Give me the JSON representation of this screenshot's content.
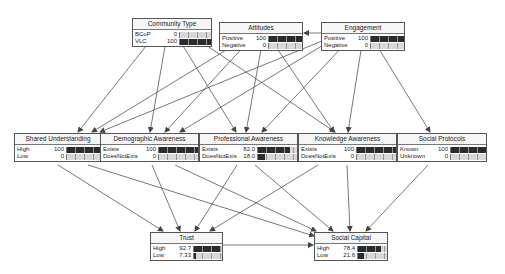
{
  "diagram": {
    "type": "bayesian-network",
    "nodes": [
      {
        "id": "community_type",
        "title": "Community Type",
        "x": 132,
        "y": 18,
        "w": 80,
        "lblw": 28,
        "states": [
          {
            "label": "BCoP",
            "value": "0",
            "pct": 0
          },
          {
            "label": "VLC",
            "value": "100",
            "pct": 100
          }
        ]
      },
      {
        "id": "attitudes",
        "title": "Attitudes",
        "x": 219,
        "y": 22,
        "w": 84,
        "lblw": 32,
        "states": [
          {
            "label": "Positive",
            "value": "100",
            "pct": 100
          },
          {
            "label": "Negative",
            "value": "0",
            "pct": 0
          }
        ]
      },
      {
        "id": "engagement",
        "title": "Engagement",
        "x": 321,
        "y": 22,
        "w": 84,
        "lblw": 32,
        "states": [
          {
            "label": "Positive",
            "value": "100",
            "pct": 100
          },
          {
            "label": "Negative",
            "value": "0",
            "pct": 0
          }
        ]
      },
      {
        "id": "shared_understanding",
        "title": "Shared Understanding",
        "x": 14,
        "y": 133,
        "w": 88,
        "lblw": 30,
        "states": [
          {
            "label": "High",
            "value": "100",
            "pct": 100
          },
          {
            "label": "Low",
            "value": "0",
            "pct": 0
          }
        ]
      },
      {
        "id": "demographic_awareness",
        "title": "Demographic Awareness",
        "x": 100,
        "y": 133,
        "w": 99,
        "lblw": 43,
        "states": [
          {
            "label": "Exists",
            "value": "100",
            "pct": 100
          },
          {
            "label": "DoesNotExist",
            "value": "0",
            "pct": 0
          }
        ]
      },
      {
        "id": "professional_awareness",
        "title": "Professional Awareness",
        "x": 199,
        "y": 133,
        "w": 99,
        "lblw": 43,
        "states": [
          {
            "label": "Exists",
            "value": "82.0",
            "pct": 82
          },
          {
            "label": "DoesNotExist",
            "value": "18.0",
            "pct": 18
          }
        ]
      },
      {
        "id": "knowledge_awareness",
        "title": "Knowledge Awareness",
        "x": 298,
        "y": 133,
        "w": 99,
        "lblw": 43,
        "states": [
          {
            "label": "Exists",
            "value": "100",
            "pct": 100
          },
          {
            "label": "DoesNotExist",
            "value": "0",
            "pct": 0
          }
        ]
      },
      {
        "id": "social_protocols",
        "title": "Social Protocols",
        "x": 397,
        "y": 133,
        "w": 90,
        "lblw": 30,
        "states": [
          {
            "label": "Known",
            "value": "100",
            "pct": 100
          },
          {
            "label": "Unknown",
            "value": "0",
            "pct": 0
          }
        ]
      },
      {
        "id": "trust",
        "title": "Trust",
        "x": 150,
        "y": 232,
        "w": 73,
        "lblw": 22,
        "states": [
          {
            "label": "High",
            "value": "92.7",
            "pct": 92.7
          },
          {
            "label": "Low",
            "value": "7.33",
            "pct": 7.33
          }
        ]
      },
      {
        "id": "social_capital",
        "title": "Social Capital",
        "x": 314,
        "y": 232,
        "w": 74,
        "lblw": 22,
        "states": [
          {
            "label": "High",
            "value": "78.4",
            "pct": 78.4
          },
          {
            "label": "Low",
            "value": "21.6",
            "pct": 21.6
          }
        ]
      }
    ],
    "edges": [
      {
        "from": "community_type",
        "to": "shared_understanding",
        "x1": 150,
        "y1": 41,
        "x2": 78,
        "y2": 132
      },
      {
        "from": "community_type",
        "to": "demographic_awareness",
        "x1": 166,
        "y1": 41,
        "x2": 150,
        "y2": 132
      },
      {
        "from": "community_type",
        "to": "professional_awareness",
        "x1": 180,
        "y1": 41,
        "x2": 236,
        "y2": 132
      },
      {
        "from": "community_type",
        "to": "social_capital",
        "x1": 200,
        "y1": 41,
        "x2": 335,
        "y2": 132
      },
      {
        "from": "attitudes",
        "to": "shared_understanding",
        "x1": 236,
        "y1": 44,
        "x2": 92,
        "y2": 132
      },
      {
        "from": "attitudes",
        "to": "demographic_awareness",
        "x1": 246,
        "y1": 44,
        "x2": 165,
        "y2": 132
      },
      {
        "from": "attitudes",
        "to": "professional_awareness",
        "x1": 262,
        "y1": 44,
        "x2": 246,
        "y2": 132
      },
      {
        "from": "attitudes",
        "to": "knowledge_awareness",
        "x1": 274,
        "y1": 44,
        "x2": 334,
        "y2": 132
      },
      {
        "from": "engagement",
        "to": "attitudes",
        "x1": 321,
        "y1": 33,
        "x2": 304,
        "y2": 33
      },
      {
        "from": "engagement",
        "to": "shared_understanding",
        "x1": 322,
        "y1": 41,
        "x2": 100,
        "y2": 132
      },
      {
        "from": "engagement",
        "to": "demographic_awareness",
        "x1": 330,
        "y1": 41,
        "x2": 180,
        "y2": 132
      },
      {
        "from": "engagement",
        "to": "professional_awareness",
        "x1": 345,
        "y1": 44,
        "x2": 262,
        "y2": 132
      },
      {
        "from": "engagement",
        "to": "knowledge_awareness",
        "x1": 362,
        "y1": 44,
        "x2": 348,
        "y2": 132
      },
      {
        "from": "engagement",
        "to": "social_protocols",
        "x1": 376,
        "y1": 44,
        "x2": 430,
        "y2": 132
      },
      {
        "from": "shared_understanding",
        "to": "trust",
        "x1": 58,
        "y1": 165,
        "x2": 163,
        "y2": 231
      },
      {
        "from": "shared_understanding",
        "to": "social_capital",
        "x1": 88,
        "y1": 165,
        "x2": 314,
        "y2": 236
      },
      {
        "from": "demographic_awareness",
        "to": "trust",
        "x1": 152,
        "y1": 165,
        "x2": 180,
        "y2": 231
      },
      {
        "from": "demographic_awareness",
        "to": "social_capital",
        "x1": 175,
        "y1": 165,
        "x2": 316,
        "y2": 231
      },
      {
        "from": "professional_awareness",
        "to": "trust",
        "x1": 237,
        "y1": 165,
        "x2": 195,
        "y2": 231
      },
      {
        "from": "professional_awareness",
        "to": "social_capital",
        "x1": 255,
        "y1": 165,
        "x2": 333,
        "y2": 231
      },
      {
        "from": "knowledge_awareness",
        "to": "trust",
        "x1": 318,
        "y1": 165,
        "x2": 210,
        "y2": 231
      },
      {
        "from": "knowledge_awareness",
        "to": "social_capital",
        "x1": 347,
        "y1": 165,
        "x2": 350,
        "y2": 231
      },
      {
        "from": "social_protocols",
        "to": "social_capital",
        "x1": 428,
        "y1": 165,
        "x2": 366,
        "y2": 231
      },
      {
        "from": "trust",
        "to": "social_capital",
        "x1": 223,
        "y1": 245,
        "x2": 313,
        "y2": 245
      }
    ]
  },
  "colors": {
    "edge": "#555555",
    "bar_fill": "#2b2b2b",
    "bar_bg": "#d8d8d8",
    "node_border": "#555555"
  }
}
